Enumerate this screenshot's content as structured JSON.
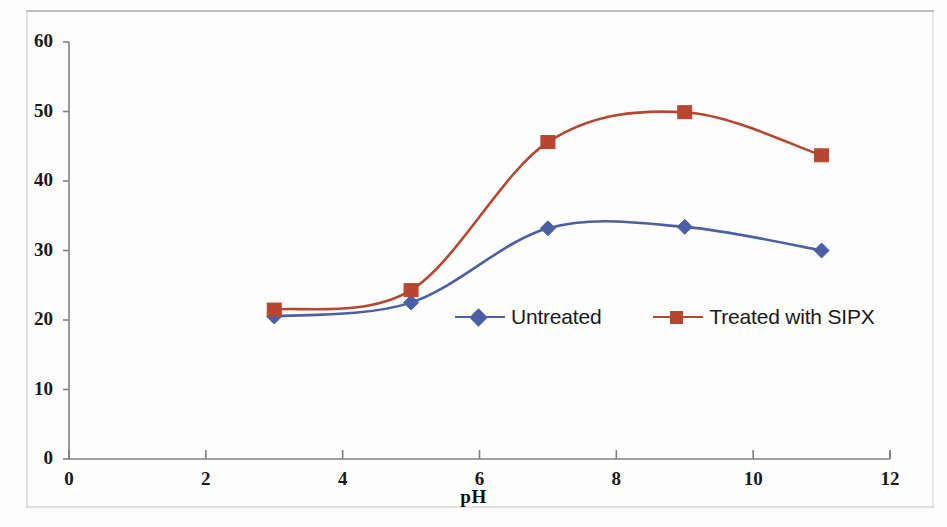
{
  "chart_data": {
    "type": "line",
    "title": "",
    "xlabel": "pH",
    "ylabel": "",
    "xlim": [
      0,
      12
    ],
    "ylim": [
      0,
      60
    ],
    "xticks": [
      0,
      2,
      4,
      6,
      8,
      10,
      12
    ],
    "yticks": [
      0,
      10,
      20,
      30,
      40,
      50,
      60
    ],
    "grid": false,
    "legend_position": "inside-center-right",
    "x": [
      3,
      5,
      7,
      9,
      11
    ],
    "series": [
      {
        "name": "Untreated",
        "color": "#4a5fa5",
        "marker": "diamond",
        "values": [
          20.5,
          22.5,
          33.2,
          33.4,
          30.0
        ]
      },
      {
        "name": "Treated with SIPX",
        "color": "#b8452f",
        "marker": "square",
        "values": [
          21.5,
          24.3,
          45.6,
          49.9,
          43.7
        ]
      }
    ]
  },
  "axes": {
    "x_tick_labels": [
      "0",
      "2",
      "4",
      "6",
      "8",
      "10",
      "12"
    ],
    "y_tick_labels": [
      "0",
      "10",
      "20",
      "30",
      "40",
      "50",
      "60"
    ],
    "x_axis_title": "pH"
  },
  "legend": {
    "entries": [
      {
        "label": "Untreated",
        "color": "#4a5fa5",
        "marker": "diamond"
      },
      {
        "label": "Treated with SIPX",
        "color": "#b8452f",
        "marker": "square"
      }
    ]
  },
  "colors": {
    "untreated": "#4a5fa5",
    "treated": "#b8452f",
    "axis": "#808080",
    "text": "#1a1a1a"
  }
}
